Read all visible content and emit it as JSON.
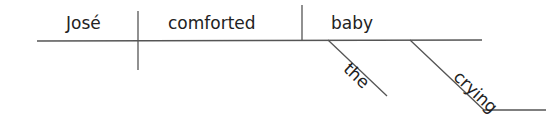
{
  "diagram": {
    "type": "sentence-diagram",
    "sentence": "José comforted the crying baby",
    "line_color": "#555555",
    "subject": "José",
    "verb": "comforted",
    "object": "baby",
    "modifiers": [
      {
        "word": "the",
        "modifies": "baby"
      },
      {
        "word": "crying",
        "modifies": "baby"
      }
    ]
  }
}
